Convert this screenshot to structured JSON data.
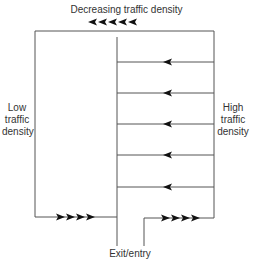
{
  "diagram": {
    "title": "Decreasing traffic density",
    "left_label": [
      "Low",
      "traffic",
      "density"
    ],
    "right_label": [
      "High",
      "traffic",
      "density"
    ],
    "bottom_label": "Exit/entry",
    "line_color": "#555555",
    "arrow_color": "#111111",
    "aisle_count": 5,
    "top_arrow_count": 5,
    "bottom_left_arrow_count": 4,
    "bottom_right_arrow_count": 4
  }
}
